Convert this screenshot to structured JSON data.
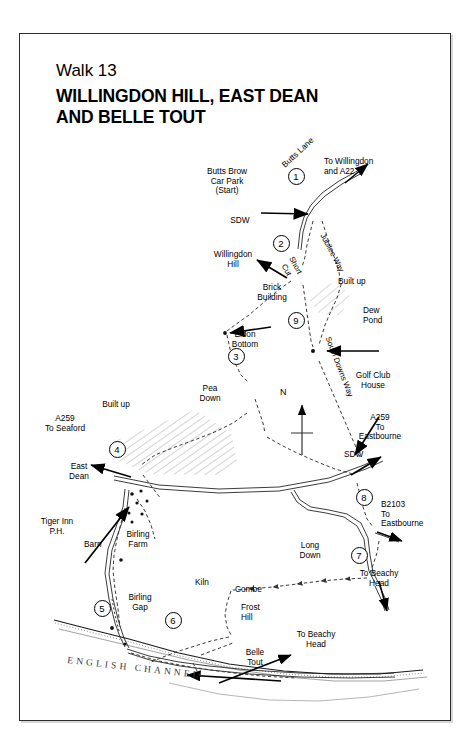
{
  "page": {
    "walk_number": "Walk 13",
    "title_line1": "WILLINGDON HILL, EAST DEAN",
    "title_line2": "AND BELLE TOUT",
    "sea_label": "ENGLISH CHANNEL",
    "compass_label": "N",
    "frame_color": "#2b2b2b",
    "ink_color": "#000000"
  },
  "markers": [
    {
      "num": "1",
      "x": 296,
      "y": 176
    },
    {
      "num": "2",
      "x": 281,
      "y": 243
    },
    {
      "num": "3",
      "x": 236,
      "y": 356
    },
    {
      "num": "4",
      "x": 117,
      "y": 449
    },
    {
      "num": "5",
      "x": 102,
      "y": 608
    },
    {
      "num": "6",
      "x": 173,
      "y": 620
    },
    {
      "num": "7",
      "x": 359,
      "y": 555
    },
    {
      "num": "8",
      "x": 364,
      "y": 497
    },
    {
      "num": "9",
      "x": 296,
      "y": 320
    }
  ],
  "labels": {
    "butts_lane": "Butts Lane",
    "to_willingdon": "To Willingdon\nand A22",
    "butts_brow": "Butts Brow\nCar Park\n(Start)",
    "sdw_top": "SDW",
    "willingdon_hill": "Willingdon\nHill",
    "jubilee_way": "Jubilee Way",
    "short_cut": "Short\nCut",
    "built_up_right": "Built up",
    "brick_building": "Brick\nBuilding",
    "dew_pond": "Dew\nPond",
    "eldon_bottom": "Eldon\nBottom",
    "south_downs_way": "South Downs Way",
    "pea_down": "Pea\nDown",
    "built_up_left": "Built up",
    "golf_club_house": "Golf Club\nHouse",
    "a259_seaford": "A259\nTo Seaford",
    "a259_eastbourne": "A259\nTo\nEastbourne",
    "sdw_right": "SDW",
    "east_dean": "East\nDean",
    "tiger_inn": "Tiger Inn\nP.H.",
    "barn": "Barn",
    "birling_farm": "Birling\nFarm",
    "birling_gap": "Birling\nGap",
    "b2103_eastbourne": "B2103\nTo\nEastbourne",
    "long_down": "Long\nDown",
    "to_beachy_head_1": "To Beachy\nHead",
    "to_beachy_head_2": "To Beachy\nHead",
    "kiln": "Kiln",
    "combe": "Combe",
    "frost_hill": "Frost\nHill",
    "belle_tout": "Belle\nTout"
  }
}
